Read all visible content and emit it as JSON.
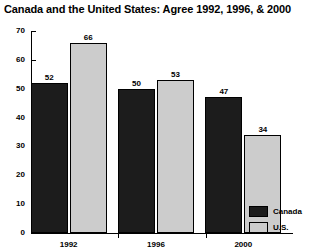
{
  "chart_data": {
    "type": "bar",
    "title": "Canada and the United States: Agree 1992, 1996, & 2000",
    "xlabel": "",
    "ylabel": "",
    "categories": [
      "1992",
      "1996",
      "2000"
    ],
    "series": [
      {
        "name": "Canada",
        "values": [
          52,
          50,
          47
        ],
        "color": "#1c1c1c"
      },
      {
        "name": "U.S.",
        "values": [
          66,
          53,
          34
        ],
        "color": "#cccccc"
      }
    ],
    "ylim": [
      0,
      70
    ],
    "yticks": [
      0,
      10,
      20,
      30,
      40,
      50,
      60,
      70
    ],
    "ytick_labels": [
      "0",
      "10",
      "20",
      "30",
      "40",
      "50",
      "60",
      "70"
    ],
    "grid": false,
    "legend_position": "bottom-right",
    "data_labels": [
      "52",
      "66",
      "50",
      "53",
      "47",
      "34"
    ]
  },
  "legend": {
    "items": [
      {
        "label": "Canada",
        "swatch": "canada"
      },
      {
        "label": "U.S.",
        "swatch": "us"
      }
    ]
  }
}
